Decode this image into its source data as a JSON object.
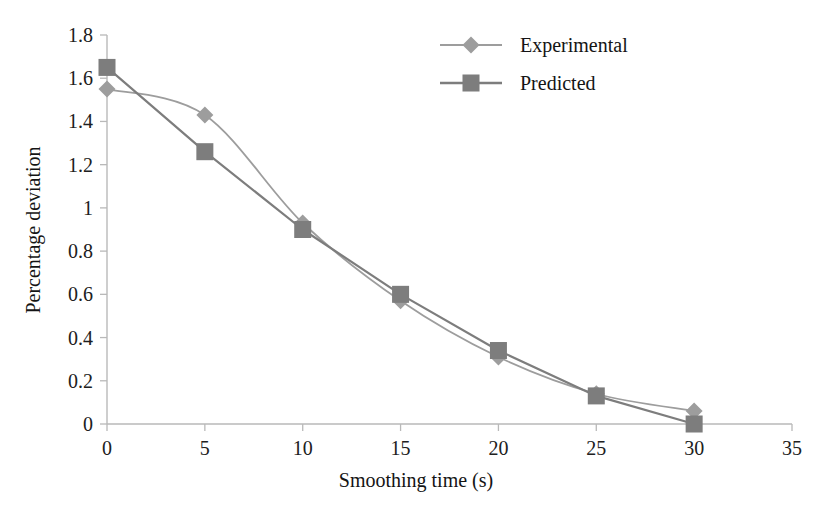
{
  "chart_data": {
    "type": "line",
    "title": "",
    "subtitle": "",
    "xlabel": "Smoothing time (s)",
    "ylabel": "Percentage deviation",
    "x": [
      0,
      5,
      10,
      15,
      20,
      25,
      30
    ],
    "xlim": [
      0,
      35
    ],
    "ylim": [
      0,
      1.8
    ],
    "xticks": [
      "0",
      "5",
      "10",
      "15",
      "20",
      "25",
      "30",
      "35"
    ],
    "xtick_values": [
      0,
      5,
      10,
      15,
      20,
      25,
      30,
      35
    ],
    "yticks": [
      "0",
      "0.2",
      "0.4",
      "0.6",
      "0.8",
      "1",
      "1.2",
      "1.4",
      "1.6",
      "1.8"
    ],
    "ytick_values": [
      0,
      0.2,
      0.4,
      0.6,
      0.8,
      1.0,
      1.2,
      1.4,
      1.6,
      1.8
    ],
    "grid": false,
    "legend_position": "top-right",
    "series": [
      {
        "name": "Experimental",
        "marker": "diamond",
        "color": "#9d9d9d",
        "smooth": true,
        "values": [
          1.55,
          1.43,
          0.93,
          0.57,
          0.31,
          0.14,
          0.06
        ]
      },
      {
        "name": "Predicted",
        "marker": "square",
        "color": "#7d7d7d",
        "smooth": false,
        "values": [
          1.65,
          1.26,
          0.9,
          0.6,
          0.34,
          0.13,
          0.0
        ]
      }
    ]
  },
  "legend": {
    "items": [
      {
        "label": "Experimental"
      },
      {
        "label": "Predicted"
      }
    ]
  },
  "axes": {
    "x_title": "Smoothing time (s)",
    "y_title": "Percentage deviation"
  },
  "colors": {
    "experimental": "#9d9d9d",
    "predicted": "#7d7d7d",
    "axis": "#b9b9b9",
    "text": "#141414",
    "background": "#ffffff"
  }
}
